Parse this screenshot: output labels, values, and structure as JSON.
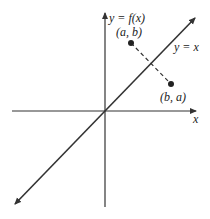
{
  "diagram": {
    "y_axis_label": "y = f(x)",
    "x_axis_label": "x",
    "line_label": "y = x",
    "point_1_label": "(a, b)",
    "point_2_label": "(b, a)",
    "colors": {
      "stroke": "#333333",
      "background": "#ffffff"
    }
  }
}
